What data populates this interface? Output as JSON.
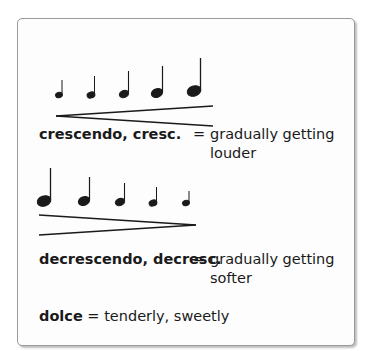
{
  "crescendo": {
    "figure": {
      "notes": [
        {
          "x": 14,
          "size": 0.6,
          "stem": 16
        },
        {
          "x": 47,
          "size": 0.7,
          "stem": 20
        },
        {
          "x": 80,
          "size": 0.8,
          "stem": 24
        },
        {
          "x": 114,
          "size": 0.95,
          "stem": 28
        },
        {
          "x": 150,
          "size": 1.15,
          "stem": 34
        }
      ],
      "hairpin": "opening"
    },
    "term": "crescendo, cresc.",
    "equals": "=",
    "definition_line1": "gradually getting",
    "definition_line2": "louder"
  },
  "decrescendo": {
    "figure": {
      "notes": [
        {
          "x": 15,
          "size": 1.15,
          "stem": 34
        },
        {
          "x": 57,
          "size": 0.95,
          "stem": 28
        },
        {
          "x": 93,
          "size": 0.8,
          "stem": 24
        },
        {
          "x": 125,
          "size": 0.7,
          "stem": 20
        },
        {
          "x": 157,
          "size": 0.6,
          "stem": 16
        }
      ],
      "hairpin": "closing"
    },
    "term": "decrescendo, decresc.",
    "equals": "=",
    "definition_line1": "gradually getting",
    "definition_line2": "softer"
  },
  "dolce": {
    "term": "dolce",
    "equals": "=",
    "definition": "tenderly, sweetly"
  },
  "colors": {
    "ink": "#1a1a1a",
    "border": "#9a9a9a",
    "background": "#fdfdfd"
  }
}
